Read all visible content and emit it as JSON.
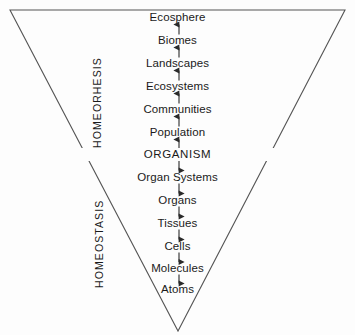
{
  "diagram": {
    "shape": "inverted-triangle",
    "center_level": "ORGANISM",
    "side_labels": {
      "upper": "HOMEORHESIS",
      "lower": "HOMEOSTASIS"
    },
    "colors": {
      "background": "#fdfdfd",
      "line": "#4a4a4a",
      "text": "#1a1a1a"
    },
    "levels_above": [
      {
        "label": "Ecosphere",
        "y": 18
      },
      {
        "label": "Biomes",
        "y": 41
      },
      {
        "label": "Landscapes",
        "y": 64
      },
      {
        "label": "Ecosystems",
        "y": 87
      },
      {
        "label": "Communities",
        "y": 110
      },
      {
        "label": "Population",
        "y": 133
      }
    ],
    "center": {
      "label": "ORGANISM",
      "y": 155
    },
    "levels_below": [
      {
        "label": "Organ Systems",
        "y": 178
      },
      {
        "label": "Organs",
        "y": 201
      },
      {
        "label": "Tissues",
        "y": 224
      },
      {
        "label": "Cells",
        "y": 247
      },
      {
        "label": "Molecules",
        "y": 269
      },
      {
        "label": "Atoms",
        "y": 290
      }
    ],
    "arrows_above_direction": "up",
    "arrows_below_direction": "down",
    "divider_line": {
      "x1": 80,
      "x2": 278,
      "y": 155
    }
  }
}
